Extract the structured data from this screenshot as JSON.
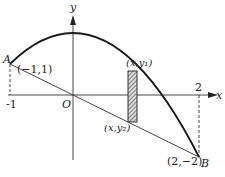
{
  "diagram": {
    "axes": {
      "x_label": "x",
      "y_label": "y",
      "origin_label": "O",
      "tick_neg1": "-1",
      "tick_2": "2"
    },
    "curve": {
      "equation": "y = 2 - x^2",
      "color": "#1a1a1a"
    },
    "line": {
      "equation": "y = -x",
      "color": "#333333"
    },
    "points": {
      "A": {
        "name": "A",
        "coords": "(−1,1)"
      },
      "B": {
        "name": "B",
        "coords": "(2,−2)"
      }
    },
    "strip": {
      "top_label": "(x,y₁)",
      "bottom_label": "(x,y₂)",
      "fill": "hatched"
    }
  }
}
